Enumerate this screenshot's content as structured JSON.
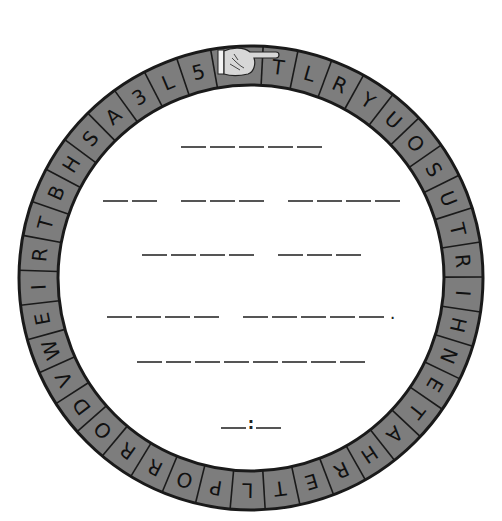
{
  "puzzle": {
    "title": "Cipher wheel decoder",
    "colors": {
      "ring_fill": "#7d7d7d",
      "ring_stroke": "#1a1a1a",
      "letter": "#111111",
      "blank_line": "#555555",
      "background": "#ffffff"
    },
    "pointer": {
      "icon": "pointing-hand-icon",
      "direction": "right"
    },
    "ring_letters_clockwise_from_pointer": [
      "T",
      "L",
      "R",
      "Y",
      "U",
      "O",
      "S",
      "U",
      "T",
      "R",
      "I",
      "H",
      "N",
      "E",
      "T",
      "A",
      "H",
      "R",
      "E",
      "T",
      "L",
      "P",
      "O",
      "R",
      "R",
      "O",
      "D",
      "V",
      "W",
      "E",
      "I",
      "R",
      "T",
      "B",
      "H",
      "S",
      "A",
      "3",
      "L",
      "5"
    ],
    "rows": [
      {
        "y": 148,
        "words": [
          5
        ],
        "suffix": ""
      },
      {
        "y": 202,
        "words": [
          2,
          3,
          4
        ],
        "suffix": ""
      },
      {
        "y": 256,
        "words": [
          4,
          3
        ],
        "suffix": ""
      },
      {
        "y": 310,
        "words": [
          4,
          5
        ],
        "suffix": "."
      },
      {
        "y": 363,
        "words": [
          8
        ],
        "suffix": ""
      },
      {
        "y": 421,
        "words": [
          1,
          1
        ],
        "separator": ":",
        "suffix": ""
      }
    ],
    "period": ".",
    "colon": ":"
  }
}
